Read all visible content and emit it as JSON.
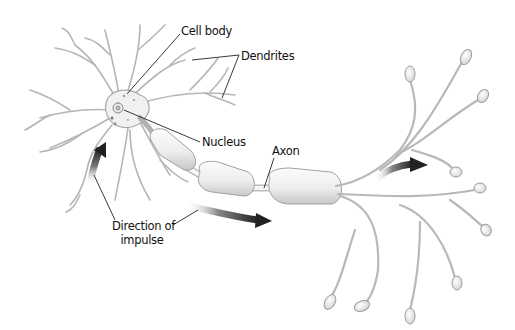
{
  "diagram": {
    "labels": {
      "cell_body": "Cell body",
      "dendrites": "Dendrites",
      "nucleus": "Nucleus",
      "axon": "Axon",
      "direction_line1": "Direction of",
      "direction_line2": "impulse"
    },
    "components": [
      "dendrites",
      "cell body",
      "nucleus",
      "axon with myelin sheath segments",
      "axon terminals",
      "impulse direction arrows"
    ],
    "colors": {
      "background": "#ffffff",
      "outline": "#9a9a9a",
      "fill_light": "#f4f4f4",
      "fill_shade": "#d6d6d6",
      "arrow_dark": "#2a2a2a",
      "leader_line": "#222222",
      "text": "#111111"
    }
  }
}
